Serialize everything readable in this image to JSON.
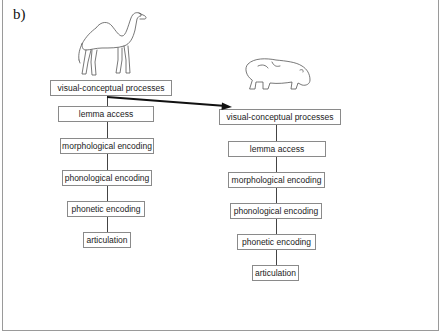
{
  "panel_label": "b)",
  "left_column": {
    "image": "camel-drawing",
    "stages": [
      "visual-conceptual processes",
      "lemma access",
      "morphological encoding",
      "phonological encoding",
      "phonetic encoding",
      "articulation"
    ]
  },
  "right_column": {
    "image": "hippopotamus-drawing",
    "stages": [
      "visual-conceptual processes",
      "lemma access",
      "morphological encoding",
      "phonological encoding",
      "phonetic encoding",
      "articulation"
    ]
  },
  "connection": {
    "from": "left visual-conceptual processes",
    "to": "right visual-conceptual processes",
    "style": "bold arrow"
  }
}
